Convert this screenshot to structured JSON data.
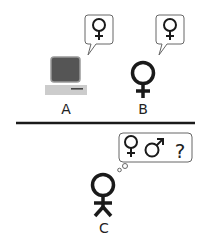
{
  "diagram": {
    "colors": {
      "stroke": "#1a1a1a",
      "monitor_screen": "#555555",
      "monitor_bezel": "#888888",
      "computer_base": "#cccccc",
      "bubble_border": "#666666",
      "background": "#ffffff"
    },
    "participants": [
      {
        "id": "A",
        "label": "A",
        "kind": "computer",
        "bubble_type": "speech",
        "bubble_text": "♀"
      },
      {
        "id": "B",
        "label": "B",
        "kind": "woman",
        "bubble_type": "speech",
        "bubble_text": "♀"
      },
      {
        "id": "C",
        "label": "C",
        "kind": "interrogator",
        "bubble_type": "thought",
        "bubble_text": [
          "♀",
          "♂",
          "?"
        ]
      }
    ],
    "divider": "barrier between A/B and C"
  }
}
